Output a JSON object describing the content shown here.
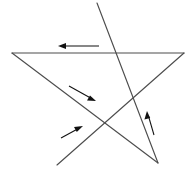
{
  "figure": {
    "canvas": {
      "width": 191,
      "height": 174,
      "background": "#ffffff"
    },
    "line_color": "#4d4d4d",
    "arrow_color": "#111111",
    "line_width": 1.15,
    "vertices": {
      "top_apex": {
        "x": 97,
        "y": 3
      },
      "left": {
        "x": 12,
        "y": 53
      },
      "right": {
        "x": 184,
        "y": 53
      },
      "bottom_left": {
        "x": 57,
        "y": 165
      },
      "bottom_right": {
        "x": 158,
        "y": 163
      }
    },
    "segments": [
      {
        "name": "segment-right-to-left",
        "from": {
          "x": 184,
          "y": 53
        },
        "to": {
          "x": 12,
          "y": 53
        },
        "direction": "leftward",
        "d": "M 184 53 L 12 53"
      },
      {
        "name": "segment-left-to-bottom-right",
        "from": {
          "x": 12,
          "y": 53
        },
        "to": {
          "x": 158,
          "y": 163
        },
        "direction": "down-right",
        "d": "M 12 53 L 158 163"
      },
      {
        "name": "segment-bottom-left-to-right",
        "from": {
          "x": 57,
          "y": 165
        },
        "to": {
          "x": 184,
          "y": 53
        },
        "direction": "up-right",
        "d": "M 57 165 L 184 53"
      },
      {
        "name": "segment-bottom-right-to-top-apex",
        "from": {
          "x": 158,
          "y": 163
        },
        "to": {
          "x": 97,
          "y": 3
        },
        "direction": "up-left",
        "d": "M 158 163 L 97 3"
      }
    ],
    "crossings": [
      {
        "name": "crossing-center",
        "x": 103,
        "y": 123
      },
      {
        "name": "crossing-upper-right",
        "x": 133,
        "y": 92
      }
    ],
    "arrows": [
      {
        "name": "arrow-top-leftward",
        "label": "leftward along top edge",
        "tail": {
          "x": 99,
          "y": 46
        },
        "tip": {
          "x": 58,
          "y": 46
        },
        "shaft_d": "M 99 46 L 63 46",
        "head_d": "M 58 46 L 66 43.1 L 66 48.9 Z"
      },
      {
        "name": "arrow-upper-left-down-right",
        "label": "down-right along left descending edge",
        "tail": {
          "x": 69,
          "y": 86
        },
        "tip": {
          "x": 96,
          "y": 101
        },
        "shaft_d": "M 69 86 L 91 98.3",
        "head_d": "M 96 101 L 87 100.6 L 90 95.4 Z"
      },
      {
        "name": "arrow-lower-left-up-right",
        "label": "up-right along bottom-left ascending edge",
        "tail": {
          "x": 61,
          "y": 138
        },
        "tip": {
          "x": 83,
          "y": 126
        },
        "shaft_d": "M 61 138 L 78 128.7",
        "head_d": "M 83 126 L 74 126.9 L 76.8 131.9 Z"
      },
      {
        "name": "arrow-right-up-left",
        "label": "up-left along right ascending edge",
        "tail": {
          "x": 154,
          "y": 135
        },
        "tip": {
          "x": 147,
          "y": 111
        },
        "shaft_d": "M 154 135 L 148.6 116.5",
        "head_d": "M 147 111 L 144.4 119.6 L 150.2 118 Z"
      }
    ]
  }
}
